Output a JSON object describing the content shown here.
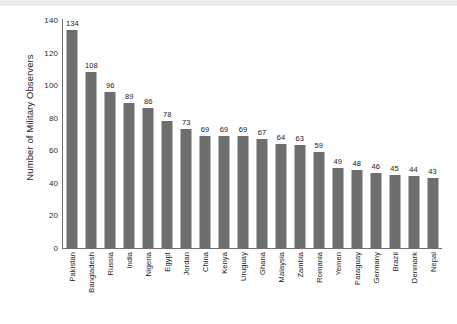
{
  "chart_data": {
    "type": "bar",
    "title": "",
    "xlabel": "",
    "ylabel": "Number of Military Observers",
    "ylim": [
      0,
      140
    ],
    "yticks": [
      0,
      20,
      40,
      60,
      80,
      100,
      120,
      140
    ],
    "grid": false,
    "legend": null,
    "bar_color": "#6e6e6e",
    "axis_color": "#6f6f6f",
    "text_color": "#1a1a1a",
    "value_labels_shown": true,
    "categories": [
      "Pakistan",
      "Bangladesh",
      "Russia",
      "India",
      "Nigeria",
      "Egypt",
      "Jordan",
      "China",
      "Kenya",
      "Uruguay",
      "Ghana",
      "Malaysia",
      "Zambia",
      "Romania",
      "Yemen",
      "Paraguay",
      "Germany",
      "Brazil",
      "Denmark",
      "Nepal"
    ],
    "values": [
      134,
      108,
      96,
      89,
      86,
      78,
      73,
      69,
      69,
      69,
      67,
      64,
      63,
      59,
      49,
      48,
      46,
      45,
      44,
      43
    ]
  }
}
